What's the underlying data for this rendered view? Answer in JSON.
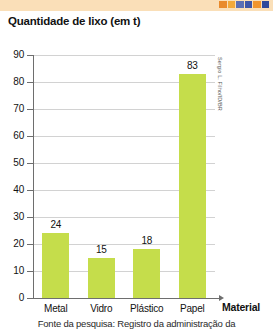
{
  "banner": {
    "background_color": "#fadfb8",
    "stripe_colors": [
      "#e98a2b",
      "#f2a93b",
      "#5a6fb5",
      "#3e56a8",
      "#f0952f",
      "#2f4a9c"
    ]
  },
  "credit": {
    "text": "Sergio L. Filho/ID/BR"
  },
  "caption": {
    "text": "Fonte da pesquisa: Registro da administração da"
  },
  "chart_data": {
    "type": "bar",
    "title": "Quantidade de lixo (em t)",
    "xlabel": "Material",
    "ylabel": "",
    "categories": [
      "Metal",
      "Vidro",
      "Plástico",
      "Papel"
    ],
    "values": [
      24,
      15,
      18,
      83
    ],
    "value_labels": [
      "24",
      "15",
      "18",
      "83"
    ],
    "ylim": [
      0,
      90
    ],
    "ytick_step": 10,
    "yticks": [
      0,
      10,
      20,
      30,
      40,
      50,
      60,
      70,
      80,
      90
    ],
    "ytick_labels": [
      "0",
      "10",
      "20",
      "30",
      "40",
      "50",
      "60",
      "70",
      "80",
      "90"
    ],
    "grid": true,
    "legend": false,
    "bar_color": "#c5dd4b"
  }
}
